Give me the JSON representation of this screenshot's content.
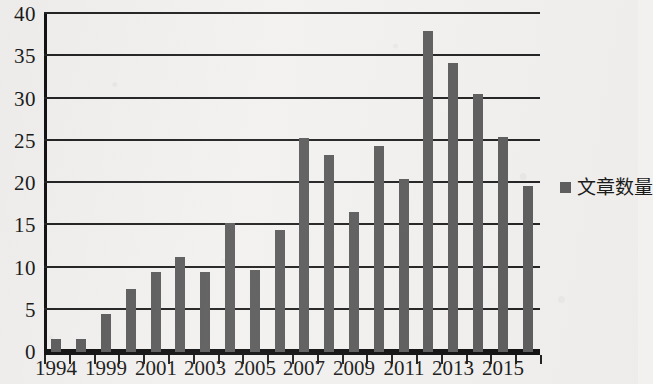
{
  "chart_data": {
    "type": "bar",
    "title": "",
    "subtitle": "",
    "xlabel": "",
    "ylabel": "",
    "ylim": [
      0,
      40
    ],
    "ytick_step": 5,
    "yticks": [
      0,
      5,
      10,
      15,
      20,
      25,
      30,
      35,
      40
    ],
    "ytick_labels": [
      "0",
      "5",
      "10",
      "15",
      "20",
      "25",
      "30",
      "35",
      "40"
    ],
    "grid": true,
    "grid_axis": "y",
    "legend_position": "right",
    "series": [
      {
        "name": "文章数量",
        "color": "#5d5d5d",
        "values": [
          1.5,
          1.5,
          4.5,
          7.5,
          9.5,
          11.3,
          9.5,
          15.3,
          9.7,
          14.4,
          25.3,
          23.3,
          16.6,
          24.4,
          20.5,
          38.0,
          34.2,
          30.5,
          25.5,
          19.6
        ]
      }
    ],
    "categories": [
      "1994",
      "1995",
      "1999",
      "2000",
      "2001",
      "2002",
      "2003",
      "2004",
      "2005",
      "2006",
      "2007",
      "2008",
      "2009",
      "2010",
      "2011",
      "2012",
      "2013",
      "2014",
      "2015",
      "2016"
    ],
    "xtick_labels_visible": [
      "1994",
      "1999",
      "2001",
      "2003",
      "2005",
      "2007",
      "2009",
      "2011",
      "2013",
      "2015"
    ],
    "xtick_label_indices": [
      0,
      2,
      4,
      6,
      8,
      10,
      12,
      14,
      16,
      18
    ]
  },
  "legend": {
    "label": "文章数量",
    "swatch_color": "#5d5d5d",
    "marker": "square-marker-icon"
  },
  "axes": {
    "y_max_label": "40",
    "y_min_label": "0"
  }
}
